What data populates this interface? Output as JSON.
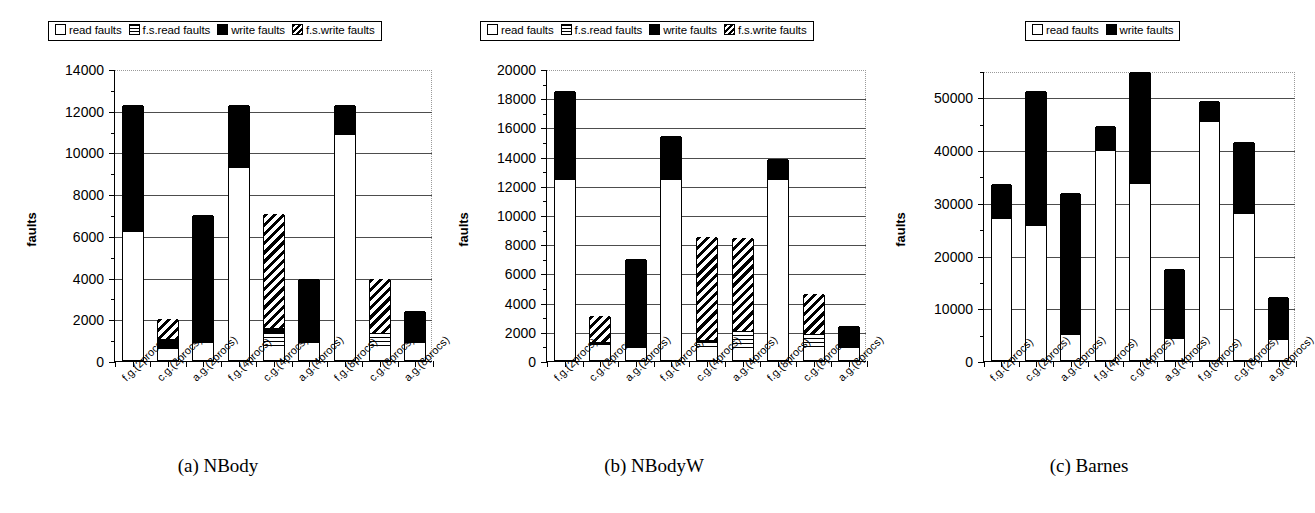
{
  "figure": {
    "categories": [
      "f.g.(2procs)",
      "c.g.(2procs)",
      "a.g.(2procs)",
      "f.g.(4procs)",
      "c.g.(4procs)",
      "a.g.(4procs)",
      "f.g.(8procs)",
      "c.g.(8procs)",
      "a.g.(8procs)"
    ],
    "legend_full": [
      {
        "label": "read faults",
        "swatch": "read-faults-swatch",
        "fill": "white"
      },
      {
        "label": "f.s.read faults",
        "swatch": "fs-read-faults-swatch",
        "fill": "horizontal-stripes"
      },
      {
        "label": "write faults",
        "swatch": "write-faults-swatch",
        "fill": "black"
      },
      {
        "label": "f.s.write faults",
        "swatch": "fs-write-faults-swatch",
        "fill": "diagonal-stripes"
      }
    ],
    "legend_short": [
      {
        "label": "read faults",
        "swatch": "read-faults-swatch",
        "fill": "white"
      },
      {
        "label": "write faults",
        "swatch": "write-faults-swatch",
        "fill": "black"
      }
    ],
    "ylabel": "faults",
    "captions": {
      "a": "(a) NBody",
      "b": "(b) NBodyW",
      "c": "(c) Barnes"
    }
  },
  "chart_data": [
    {
      "id": "a",
      "type": "bar",
      "stacked": true,
      "title": "(a) NBody",
      "xlabel": "",
      "ylabel": "faults",
      "ylim": [
        0,
        14000
      ],
      "yticks": [
        0,
        2000,
        4000,
        6000,
        8000,
        10000,
        12000,
        14000
      ],
      "ytick_labels": [
        "0",
        "2000",
        "4000",
        "6000",
        "8000",
        "10000",
        "12000",
        "14000"
      ],
      "minor_tick_step": 1000,
      "grid": true,
      "legend_position": "above-left",
      "categories": [
        "f.g.(2procs)",
        "c.g.(2procs)",
        "a.g.(2procs)",
        "f.g.(4procs)",
        "c.g.(4procs)",
        "a.g.(4procs)",
        "f.g.(8procs)",
        "c.g.(8procs)",
        "a.g.(8procs)"
      ],
      "series": [
        {
          "name": "read faults",
          "values": [
            6150,
            400,
            800,
            9200,
            600,
            800,
            10800,
            650,
            800
          ]
        },
        {
          "name": "f.s.read faults",
          "values": [
            0,
            200,
            0,
            0,
            700,
            0,
            0,
            650,
            0
          ]
        },
        {
          "name": "write faults",
          "values": [
            6100,
            400,
            6150,
            3050,
            250,
            3100,
            1450,
            0,
            1550
          ]
        },
        {
          "name": "f.s.write faults",
          "values": [
            0,
            950,
            0,
            0,
            5450,
            0,
            0,
            2600,
            0
          ]
        }
      ],
      "totals": [
        12250,
        1950,
        6950,
        12250,
        7000,
        3900,
        12250,
        3900,
        2350
      ]
    },
    {
      "id": "b",
      "type": "bar",
      "stacked": true,
      "title": "(b) NBodyW",
      "xlabel": "",
      "ylabel": "faults",
      "ylim": [
        0,
        20000
      ],
      "yticks": [
        0,
        2000,
        4000,
        6000,
        8000,
        10000,
        12000,
        14000,
        16000,
        18000,
        20000
      ],
      "ytick_labels": [
        "0",
        "2000",
        "4000",
        "6000",
        "8000",
        "10000",
        "12000",
        "14000",
        "16000",
        "18000",
        "20000"
      ],
      "minor_tick_step": 1000,
      "grid": true,
      "legend_position": "above-left",
      "categories": [
        "f.g.(2procs)",
        "c.g.(2procs)",
        "a.g.(2procs)",
        "f.g.(4procs)",
        "c.g.(4procs)",
        "a.g.(4procs)",
        "f.g.(8procs)",
        "c.g.(8procs)",
        "a.g.(8procs)"
      ],
      "series": [
        {
          "name": "read faults",
          "values": [
            12300,
            850,
            800,
            12300,
            800,
            800,
            12300,
            800,
            800
          ]
        },
        {
          "name": "f.s.read faults",
          "values": [
            0,
            250,
            0,
            0,
            450,
            1200,
            0,
            1000,
            0
          ]
        },
        {
          "name": "write faults",
          "values": [
            6150,
            150,
            6100,
            3050,
            150,
            0,
            1500,
            0,
            1500
          ]
        },
        {
          "name": "f.s.write faults",
          "values": [
            0,
            1750,
            0,
            0,
            7000,
            6350,
            0,
            2750,
            0
          ]
        }
      ],
      "totals": [
        18450,
        3000,
        6900,
        15350,
        8400,
        8350,
        13800,
        4550,
        2300
      ]
    },
    {
      "id": "c",
      "type": "bar",
      "stacked": true,
      "title": "(c) Barnes",
      "xlabel": "",
      "ylabel": "faults",
      "ylim": [
        0,
        55000
      ],
      "yticks": [
        0,
        10000,
        20000,
        30000,
        40000,
        50000
      ],
      "ytick_labels": [
        "0",
        "10000",
        "20000",
        "30000",
        "40000",
        "50000"
      ],
      "minor_tick_step": 5000,
      "grid": true,
      "legend_position": "above-right",
      "categories": [
        "f.g.(2procs)",
        "c.g.(2procs)",
        "a.g.(2procs)",
        "f.g.(4procs)",
        "c.g.(4procs)",
        "a.g.(4procs)",
        "f.g.(8procs)",
        "c.g.(8procs)",
        "a.g.(8procs)"
      ],
      "series": [
        {
          "name": "read faults",
          "values": [
            26800,
            25500,
            4700,
            39600,
            33300,
            3900,
            45200,
            27700,
            3800
          ]
        },
        {
          "name": "write faults",
          "values": [
            6500,
            25500,
            27000,
            4800,
            21400,
            13400,
            3900,
            13600,
            8200
          ]
        }
      ],
      "totals": [
        33300,
        51000,
        31700,
        44400,
        54700,
        17300,
        49100,
        41300,
        12000
      ]
    }
  ]
}
